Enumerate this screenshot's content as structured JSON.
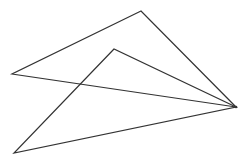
{
  "diagram": {
    "background": "#ffffff",
    "stroke_color": "#333333",
    "stroke_width": 1.2,
    "shapes": [
      {
        "type": "triangle",
        "name": "large-triangle",
        "points": [
          [
            141,
            11
          ],
          [
            12,
            74
          ],
          [
            236,
            107
          ]
        ]
      },
      {
        "type": "triangle",
        "name": "inner-triangle",
        "points": [
          [
            114,
            49
          ],
          [
            14,
            153
          ],
          [
            236,
            107
          ]
        ]
      }
    ],
    "shared_vertex": [
      236,
      107
    ]
  }
}
